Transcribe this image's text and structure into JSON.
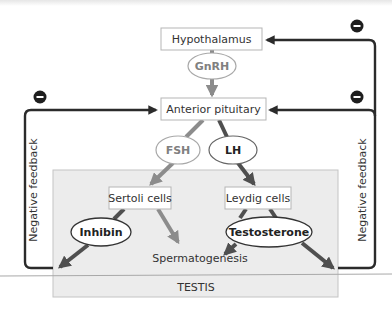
{
  "diagram": {
    "nodes": {
      "hypothalamus": "Hypothalamus",
      "gnrh": "GnRH",
      "anterior_pituitary": "Anterior pituitary",
      "fsh": "FSH",
      "lh": "LH",
      "sertoli": "Sertoli cells",
      "leydig": "Leydig cells",
      "inhibin": "Inhibin",
      "testosterone": "Testosterone",
      "spermatogenesis": "Spermatogenesis",
      "testis": "TESTIS"
    },
    "feedback": {
      "left_label": "Negative feedback",
      "right_label": "Negative feedback",
      "minus_symbol": "−"
    },
    "edges": [
      {
        "from": "Hypothalamus",
        "to": "GnRH"
      },
      {
        "from": "GnRH",
        "to": "Anterior pituitary"
      },
      {
        "from": "Anterior pituitary",
        "to": "FSH"
      },
      {
        "from": "Anterior pituitary",
        "to": "LH"
      },
      {
        "from": "FSH",
        "to": "Sertoli cells"
      },
      {
        "from": "LH",
        "to": "Leydig cells"
      },
      {
        "from": "Sertoli cells",
        "to": "Inhibin"
      },
      {
        "from": "Sertoli cells",
        "to": "Spermatogenesis"
      },
      {
        "from": "Leydig cells",
        "to": "Testosterone"
      },
      {
        "from": "Testosterone",
        "to": "Spermatogenesis"
      },
      {
        "from": "Inhibin",
        "to": "Anterior pituitary",
        "type": "negative feedback"
      },
      {
        "from": "Testosterone",
        "to": "Anterior pituitary",
        "type": "negative feedback"
      },
      {
        "from": "Testosterone",
        "to": "Hypothalamus",
        "type": "negative feedback"
      }
    ],
    "colors": {
      "gray_arrow": "#8c8c8c",
      "dark_arrow": "#4a4a4a",
      "feedback_line": "#2b2b2b",
      "testis_fill": "#ececec",
      "box_border": "#b5b5b5"
    }
  }
}
